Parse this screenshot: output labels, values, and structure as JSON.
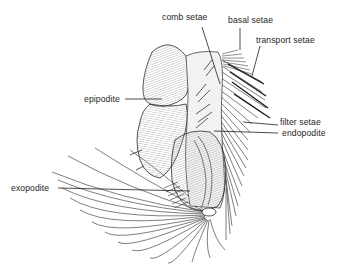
{
  "figure": {
    "labels": [
      {
        "id": "comb_setae",
        "text": "comb setae"
      },
      {
        "id": "basal_setae",
        "text": "basal setae"
      },
      {
        "id": "transport_setae",
        "text": "transport setae"
      },
      {
        "id": "epipodite",
        "text": "epipodite"
      },
      {
        "id": "filter_setae",
        "text": "filter setae"
      },
      {
        "id": "endopodite",
        "text": "endopodite"
      },
      {
        "id": "exopodite",
        "text": "exopodite"
      }
    ],
    "colors": {
      "ink": "#1e1e1e",
      "stipple": "#8a8a8a",
      "background": "#ffffff"
    }
  }
}
